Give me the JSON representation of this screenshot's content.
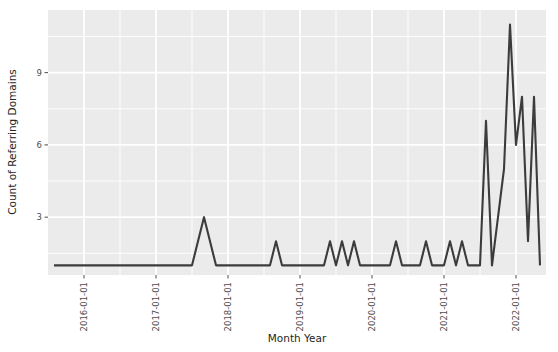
{
  "chart_data": {
    "type": "line",
    "title": "",
    "xlabel": "Month Year",
    "ylabel": "Count of Referring Domains",
    "panel_background": "#EBEBEB",
    "grid_color": "#FFFFFF",
    "line_color": "#3C3C3C",
    "figure_background": "#FFFFFF",
    "grid": true,
    "legend": "none",
    "xlim": [
      "2015-07-01",
      "2022-06-01"
    ],
    "ylim": [
      0.6,
      11.6
    ],
    "yticks": [
      3,
      6,
      9
    ],
    "ytick_labels": [
      "3",
      "6",
      "9"
    ],
    "xticks": [
      "2016-01-01",
      "2017-01-01",
      "2018-01-01",
      "2019-01-01",
      "2020-01-01",
      "2021-01-01",
      "2022-01-01"
    ],
    "xtick_labels": [
      "2016-01-01",
      "2017-01-01",
      "2018-01-01",
      "2019-01-01",
      "2020-01-01",
      "2021-01-01",
      "2022-01-01"
    ],
    "xtick_rotation": 90,
    "x": [
      "2015-08-01",
      "2015-09-01",
      "2015-10-01",
      "2015-11-01",
      "2015-12-01",
      "2016-01-01",
      "2016-02-01",
      "2016-03-01",
      "2016-04-01",
      "2016-05-01",
      "2016-06-01",
      "2016-07-01",
      "2016-08-01",
      "2016-09-01",
      "2016-10-01",
      "2016-11-01",
      "2016-12-01",
      "2017-01-01",
      "2017-02-01",
      "2017-03-01",
      "2017-04-01",
      "2017-05-01",
      "2017-06-01",
      "2017-07-01",
      "2017-08-01",
      "2017-09-01",
      "2017-10-01",
      "2017-11-01",
      "2017-12-01",
      "2018-01-01",
      "2018-02-01",
      "2018-03-01",
      "2018-04-01",
      "2018-05-01",
      "2018-06-01",
      "2018-07-01",
      "2018-08-01",
      "2018-09-01",
      "2018-10-01",
      "2018-11-01",
      "2018-12-01",
      "2019-01-01",
      "2019-02-01",
      "2019-03-01",
      "2019-04-01",
      "2019-05-01",
      "2019-06-01",
      "2019-07-01",
      "2019-08-01",
      "2019-09-01",
      "2019-10-01",
      "2019-11-01",
      "2019-12-01",
      "2020-01-01",
      "2020-02-01",
      "2020-03-01",
      "2020-04-01",
      "2020-05-01",
      "2020-06-01",
      "2020-07-01",
      "2020-08-01",
      "2020-09-01",
      "2020-10-01",
      "2020-11-01",
      "2020-12-01",
      "2021-01-01",
      "2021-02-01",
      "2021-03-01",
      "2021-04-01",
      "2021-05-01",
      "2021-06-01",
      "2021-07-01",
      "2021-08-01",
      "2021-09-01",
      "2021-10-01",
      "2021-11-01",
      "2021-12-01",
      "2022-01-01",
      "2022-02-01",
      "2022-03-01",
      "2022-04-01",
      "2022-05-01"
    ],
    "values": [
      1,
      1,
      1,
      1,
      1,
      1,
      1,
      1,
      1,
      1,
      1,
      1,
      1,
      1,
      1,
      1,
      1,
      1,
      1,
      1,
      1,
      1,
      1,
      1,
      2,
      3,
      2,
      1,
      1,
      1,
      1,
      1,
      1,
      1,
      1,
      1,
      1,
      2,
      1,
      1,
      1,
      1,
      1,
      1,
      1,
      1,
      2,
      1,
      2,
      1,
      2,
      1,
      1,
      1,
      1,
      1,
      1,
      2,
      1,
      1,
      1,
      1,
      2,
      1,
      1,
      1,
      2,
      1,
      2,
      1,
      1,
      1,
      7,
      1,
      3,
      5,
      11,
      6,
      8,
      2,
      8,
      1
    ]
  }
}
